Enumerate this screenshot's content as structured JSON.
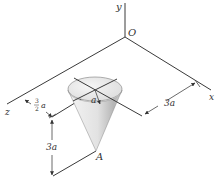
{
  "figure": {
    "type": "3D isometric mechanics diagram",
    "axes": {
      "x_label": "x",
      "y_label": "y",
      "z_label": "z",
      "origin_label": "O"
    },
    "body": {
      "shape": "right circular cone (inverted)",
      "apex_label": "A",
      "radius_label": "a"
    },
    "dimensions": {
      "offset_x": "3a",
      "offset_z_num": "3",
      "offset_z_den": "2",
      "offset_z_var": "a",
      "height": "3a"
    },
    "colors": {
      "line": "#3a3a3a",
      "cone_light": "#f2f2f2",
      "cone_shade": "#b8b8b8",
      "background": "#ffffff"
    }
  }
}
